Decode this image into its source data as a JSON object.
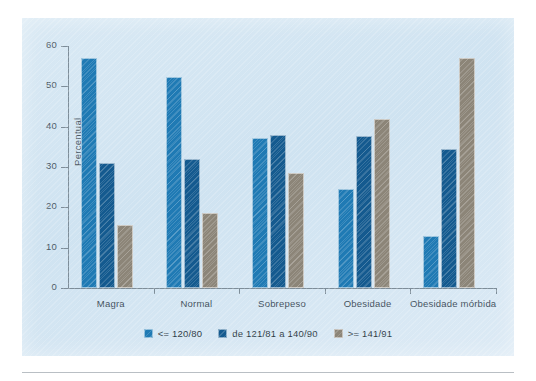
{
  "chart_data": {
    "type": "bar",
    "title": "",
    "xlabel": "",
    "ylabel": "Percentual",
    "ylim": [
      0,
      60
    ],
    "yticks": [
      0,
      10,
      20,
      30,
      40,
      50,
      60
    ],
    "ytick_labels": [
      "0",
      "10",
      "20",
      "30",
      "40",
      "50",
      "60"
    ],
    "grid": false,
    "legend_position": "bottom-center",
    "categories": [
      "Magra",
      "Normal",
      "Sobrepeso",
      "Obesidade",
      "Obesidade mórbida"
    ],
    "series": [
      {
        "name": "<= 120/80",
        "color": "#1f7ab4",
        "values": [
          57.0,
          52.3,
          37.3,
          24.5,
          13.0
        ]
      },
      {
        "name": "de 121/81 a 140/90",
        "color": "#145a8f",
        "values": [
          31.0,
          32.0,
          37.9,
          37.7,
          34.5
        ]
      },
      {
        "name": ">= 141/91",
        "color": "#8c8578",
        "values": [
          15.5,
          18.5,
          28.6,
          42.0,
          57.0
        ]
      }
    ]
  },
  "panel": {
    "background_color": "#d4e6f2"
  }
}
